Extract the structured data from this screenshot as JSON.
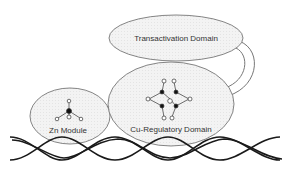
{
  "diagram": {
    "domains": [
      {
        "id": "transactivation",
        "label": "Transactivation Domain"
      },
      {
        "id": "cu-regulatory",
        "label": "Cu-Regulatory Domain"
      },
      {
        "id": "zn-module",
        "label": "Zn Module"
      }
    ],
    "elements": {
      "dna": "DNA double helix",
      "linker": "linker connecting Transactivation Domain to Cu-Regulatory Domain",
      "zn_site": "Zn coordination site",
      "cu_cluster": "Cu cluster"
    },
    "colors": {
      "domain_fill": "#f1f1f1",
      "outline": "#666666",
      "dna": "#1a1a1a",
      "atom_dark": "#111111",
      "atom_light": "#ffffff"
    }
  }
}
